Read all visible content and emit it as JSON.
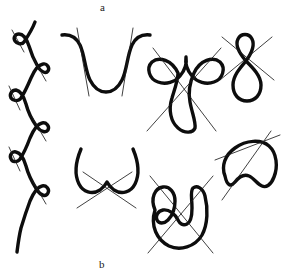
{
  "figure": {
    "label_top": "a",
    "label_bottom": "b",
    "background_color": "#ffffff",
    "curve_color": "#0d0d0d",
    "line_color": "#1f1f1f",
    "panels": [
      {
        "id": "panel-serpentine",
        "name": "serpentine-curve-with-six-loops",
        "description": "vertical wavy curve with six small alternating loops, each crossed by a short thin tangent line",
        "loop_count": 6,
        "tangent_line_count": 6
      },
      {
        "id": "panel-u-curve",
        "name": "u-shaped-curve-with-two-tangent-lines",
        "description": "smooth U shaped curve with two near-vertical thin secant lines",
        "loop_count": 0,
        "tangent_line_count": 2
      },
      {
        "id": "panel-bunny",
        "name": "two-loop-body-curve-with-crossing-lines",
        "description": "curve with two upper loops and large oval body, crossed by two diagonal lines forming an X",
        "loop_count": 2,
        "tangent_line_count": 2
      },
      {
        "id": "panel-figure-eight",
        "name": "figure-eight-curve-with-crossing-lines",
        "description": "figure eight with small upper loop and large lower loop, crossed by two diagonal lines",
        "loop_count": 2,
        "tangent_line_count": 2
      },
      {
        "id": "panel-cusp",
        "name": "cusped-arch-curve-with-crossing-lines",
        "description": "arch curve meeting in a cusp at bottom centre, crossed by two diagonal lines forming an X",
        "loop_count": 0,
        "tangent_line_count": 2
      },
      {
        "id": "panel-spiral-horseshoe",
        "name": "horseshoe-with-inner-loop-and-crossing-lines",
        "description": "horseshoe outline containing an inner nested loop, crossed by two diagonal lines forming an X",
        "loop_count": 1,
        "tangent_line_count": 2
      },
      {
        "id": "panel-bean",
        "name": "bean-shaped-curve-with-crossing-lines",
        "description": "kidney or bean shaped closed curve with notch at bottom, crossed by two diagonal lines",
        "loop_count": 0,
        "tangent_line_count": 2
      }
    ]
  }
}
